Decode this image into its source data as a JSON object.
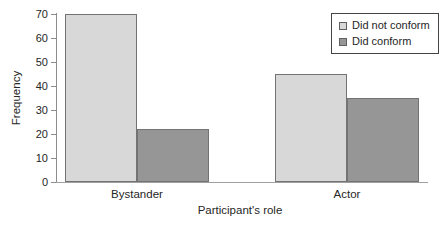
{
  "figure": {
    "background": "#ffffff"
  },
  "chart_data": {
    "type": "bar",
    "title": "",
    "categories": [
      "Bystander",
      "Actor"
    ],
    "series": [
      {
        "name": "Did not conform",
        "values": [
          70,
          45
        ],
        "color": "#d8d8d8"
      },
      {
        "name": "Did conform",
        "values": [
          22,
          35
        ],
        "color": "#969696"
      }
    ],
    "xlabel": "Participant's role",
    "ylabel": "Frequency",
    "ylim": [
      0,
      70
    ],
    "yticks": [
      0,
      10,
      20,
      30,
      40,
      50,
      60,
      70
    ],
    "grid": false,
    "legend_position": "top-right",
    "bar_fill_light": "#d8d8d8",
    "bar_fill_dark": "#969696",
    "bar_border_color": "#737373",
    "axis_color": "#8c8c8c",
    "text_color": "#262626",
    "legend_border_color": "#444444"
  }
}
